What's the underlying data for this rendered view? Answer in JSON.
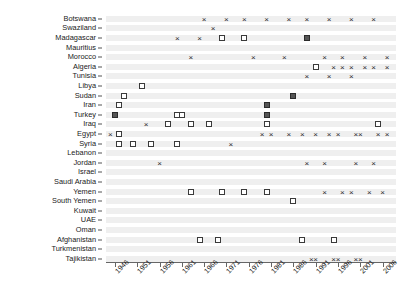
{
  "chart_data": {
    "type": "scatter",
    "title": "",
    "subtitle": "",
    "xlabel": "",
    "ylabel": "",
    "xlim": [
      1944,
      2009
    ],
    "xticks": [
      1946,
      1951,
      1956,
      1961,
      1966,
      1971,
      1976,
      1981,
      1986,
      1991,
      1996,
      2001,
      2006
    ],
    "xtick_labels": [
      "1946",
      "1951",
      "1956",
      "1961",
      "1966",
      "1971",
      "1976",
      "1981",
      "1986",
      "1991",
      "1996",
      "2001",
      "2006"
    ],
    "grid": "horizontal-bands",
    "legend": [],
    "marker_types": {
      "x": "cross-marker",
      "open": "open-square-marker",
      "filled": "filled-square-marker"
    },
    "categories": [
      "Botswana",
      "Swaziland",
      "Madagascar",
      "Mauritius",
      "Morocco",
      "Algeria",
      "Tunisia",
      "Libya",
      "Sudan",
      "Iran",
      "Turkey",
      "Iraq",
      "Egypt",
      "Syria",
      "Lebanon",
      "Jordan",
      "Israel",
      "Saudi Arabia",
      "Yemen",
      "South Yemen",
      "Kuwait",
      "UAE",
      "Oman",
      "Afghanistan",
      "Turkmenistan",
      "Tajikistan"
    ],
    "series": [
      {
        "name": "Botswana",
        "points": [
          {
            "year": 1966,
            "marker": "x"
          },
          {
            "year": 1971,
            "marker": "x"
          },
          {
            "year": 1975,
            "marker": "x"
          },
          {
            "year": 1980,
            "marker": "x"
          },
          {
            "year": 1985,
            "marker": "x"
          },
          {
            "year": 1989,
            "marker": "x"
          },
          {
            "year": 1994,
            "marker": "x"
          },
          {
            "year": 1999,
            "marker": "x"
          },
          {
            "year": 2004,
            "marker": "x"
          }
        ]
      },
      {
        "name": "Swaziland",
        "points": [
          {
            "year": 1968,
            "marker": "x"
          }
        ]
      },
      {
        "name": "Madagascar",
        "points": [
          {
            "year": 1960,
            "marker": "x"
          },
          {
            "year": 1965,
            "marker": "x"
          },
          {
            "year": 1970,
            "marker": "open"
          },
          {
            "year": 1975,
            "marker": "open"
          },
          {
            "year": 1989,
            "marker": "filled"
          }
        ]
      },
      {
        "name": "Mauritius",
        "points": []
      },
      {
        "name": "Morocco",
        "points": [
          {
            "year": 1963,
            "marker": "x"
          },
          {
            "year": 1977,
            "marker": "x"
          },
          {
            "year": 1984,
            "marker": "x"
          },
          {
            "year": 1993,
            "marker": "x"
          },
          {
            "year": 1997,
            "marker": "x"
          },
          {
            "year": 2002,
            "marker": "x"
          },
          {
            "year": 2007,
            "marker": "x"
          }
        ]
      },
      {
        "name": "Algeria",
        "points": [
          {
            "year": 1991,
            "marker": "open"
          },
          {
            "year": 1995,
            "marker": "x"
          },
          {
            "year": 1997,
            "marker": "x"
          },
          {
            "year": 1999,
            "marker": "x"
          },
          {
            "year": 2002,
            "marker": "x"
          },
          {
            "year": 2004,
            "marker": "x"
          },
          {
            "year": 2007,
            "marker": "x"
          }
        ]
      },
      {
        "name": "Tunisia",
        "points": [
          {
            "year": 1989,
            "marker": "x"
          },
          {
            "year": 1994,
            "marker": "x"
          },
          {
            "year": 1999,
            "marker": "x"
          }
        ]
      },
      {
        "name": "Libya",
        "points": [
          {
            "year": 1952,
            "marker": "open"
          }
        ]
      },
      {
        "name": "Sudan",
        "points": [
          {
            "year": 1948,
            "marker": "open"
          },
          {
            "year": 1986,
            "marker": "filled"
          }
        ]
      },
      {
        "name": "Iran",
        "points": [
          {
            "year": 1947,
            "marker": "open"
          },
          {
            "year": 1980,
            "marker": "filled"
          }
        ]
      },
      {
        "name": "Turkey",
        "points": [
          {
            "year": 1946,
            "marker": "filled"
          },
          {
            "year": 1960,
            "marker": "open"
          },
          {
            "year": 1961,
            "marker": "open"
          },
          {
            "year": 1980,
            "marker": "filled"
          }
        ]
      },
      {
        "name": "Iraq",
        "points": [
          {
            "year": 1953,
            "marker": "x"
          },
          {
            "year": 1958,
            "marker": "open"
          },
          {
            "year": 1963,
            "marker": "open"
          },
          {
            "year": 1967,
            "marker": "open"
          },
          {
            "year": 1980,
            "marker": "open"
          },
          {
            "year": 2005,
            "marker": "open"
          }
        ]
      },
      {
        "name": "Egypt",
        "points": [
          {
            "year": 1945,
            "marker": "x"
          },
          {
            "year": 1947,
            "marker": "open"
          },
          {
            "year": 1979,
            "marker": "x"
          },
          {
            "year": 1981,
            "marker": "x"
          },
          {
            "year": 1985,
            "marker": "x"
          },
          {
            "year": 1988,
            "marker": "x"
          },
          {
            "year": 1991,
            "marker": "x"
          },
          {
            "year": 1994,
            "marker": "x"
          },
          {
            "year": 1996,
            "marker": "x"
          },
          {
            "year": 2000,
            "marker": "x"
          },
          {
            "year": 2001,
            "marker": "x"
          },
          {
            "year": 2005,
            "marker": "x"
          },
          {
            "year": 2007,
            "marker": "x"
          }
        ]
      },
      {
        "name": "Syria",
        "points": [
          {
            "year": 1947,
            "marker": "open"
          },
          {
            "year": 1950,
            "marker": "open"
          },
          {
            "year": 1954,
            "marker": "open"
          },
          {
            "year": 1960,
            "marker": "open"
          },
          {
            "year": 1972,
            "marker": "x"
          }
        ]
      },
      {
        "name": "Lebanon",
        "points": []
      },
      {
        "name": "Jordan",
        "points": [
          {
            "year": 1956,
            "marker": "x"
          },
          {
            "year": 1989,
            "marker": "x"
          },
          {
            "year": 1993,
            "marker": "x"
          },
          {
            "year": 2000,
            "marker": "x"
          },
          {
            "year": 2004,
            "marker": "x"
          }
        ]
      },
      {
        "name": "Israel",
        "points": []
      },
      {
        "name": "Saudi Arabia",
        "points": []
      },
      {
        "name": "Yemen",
        "points": [
          {
            "year": 1963,
            "marker": "open"
          },
          {
            "year": 1970,
            "marker": "open"
          },
          {
            "year": 1975,
            "marker": "open"
          },
          {
            "year": 1980,
            "marker": "open"
          },
          {
            "year": 1993,
            "marker": "x"
          },
          {
            "year": 1997,
            "marker": "x"
          },
          {
            "year": 1999,
            "marker": "x"
          },
          {
            "year": 2003,
            "marker": "x"
          },
          {
            "year": 2006,
            "marker": "x"
          }
        ]
      },
      {
        "name": "South Yemen",
        "points": [
          {
            "year": 1986,
            "marker": "open"
          }
        ]
      },
      {
        "name": "Kuwait",
        "points": []
      },
      {
        "name": "UAE",
        "points": []
      },
      {
        "name": "Oman",
        "points": []
      },
      {
        "name": "Afghanistan",
        "points": [
          {
            "year": 1965,
            "marker": "open"
          },
          {
            "year": 1969,
            "marker": "open"
          },
          {
            "year": 1988,
            "marker": "open"
          },
          {
            "year": 1995,
            "marker": "open"
          }
        ]
      },
      {
        "name": "Turkmenistan",
        "points": []
      },
      {
        "name": "Tajikistan",
        "points": [
          {
            "year": 1990,
            "marker": "x"
          },
          {
            "year": 1991,
            "marker": "x"
          },
          {
            "year": 1995,
            "marker": "x"
          },
          {
            "year": 1996,
            "marker": "x"
          },
          {
            "year": 2000,
            "marker": "x"
          },
          {
            "year": 2001,
            "marker": "x"
          }
        ]
      }
    ]
  },
  "layout": {
    "plot_left": 106,
    "plot_right": 396,
    "plot_top": 14,
    "plot_bottom": 262,
    "row_height": 9.6,
    "band_height": 6,
    "band_color": "#efefef",
    "axis_color": "#666666",
    "text_color": "#1a1a1a"
  }
}
